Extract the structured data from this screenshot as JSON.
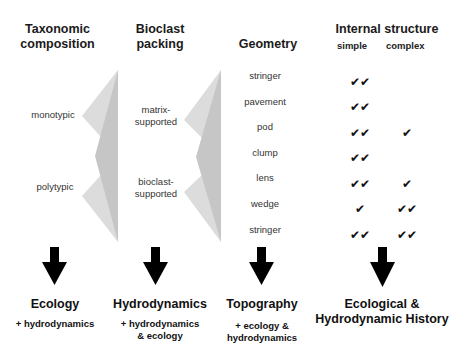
{
  "headers": {
    "taxonomic": "Taxonomic composition",
    "taxonomic_line1": "Taxonomic",
    "taxonomic_line2": "composition",
    "bioclast_line1": "Bioclast",
    "bioclast_line2": "packing",
    "geometry": "Geometry",
    "internal": "Internal structure",
    "simple": "simple",
    "complex": "complex"
  },
  "taxonomic_labels": [
    "monotypic",
    "polytypic"
  ],
  "packing_labels": [
    {
      "line1": "matrix-",
      "line2": "supported"
    },
    {
      "line1": "bioclast-",
      "line2": "supported"
    }
  ],
  "geometry_rows": [
    {
      "name": "stringer",
      "simple": "✔✔",
      "complex": ""
    },
    {
      "name": "pavement",
      "simple": "✔✔",
      "complex": ""
    },
    {
      "name": "pod",
      "simple": "✔✔",
      "complex": "✔"
    },
    {
      "name": "clump",
      "simple": "✔✔",
      "complex": ""
    },
    {
      "name": "lens",
      "simple": "✔✔",
      "complex": "✔"
    },
    {
      "name": "wedge",
      "simple": "✔",
      "complex": "✔✔"
    },
    {
      "name": "stringer",
      "simple": "✔✔",
      "complex": "✔✔"
    }
  ],
  "outcomes": [
    {
      "title": "Ecology",
      "sub1": "+ hydrodynamics",
      "sub2": ""
    },
    {
      "title": "Hydrodynamics",
      "sub1": "+ hydrodynamics",
      "sub2": "& ecology"
    },
    {
      "title": "Topography",
      "sub1": "+ ecology &",
      "sub2": "hydrodynamics"
    },
    {
      "title1": "Ecological &",
      "title2": "Hydrodynamic History"
    }
  ],
  "colors": {
    "triangle_light": "#d8d8d8",
    "triangle_dark": "#bdbdbd",
    "arrow": "#000000"
  }
}
